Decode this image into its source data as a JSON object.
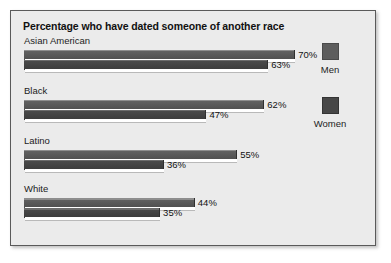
{
  "chart_data": {
    "type": "bar",
    "title": "Percentage who have dated someone of another race",
    "xlabel": "",
    "ylabel": "",
    "orientation": "horizontal",
    "grid": false,
    "xlim": [
      0,
      70
    ],
    "legend_position": "right",
    "categories": [
      "Asian American",
      "Black",
      "Latino",
      "White"
    ],
    "series": [
      {
        "name": "Men",
        "values": [
          70,
          62,
          55,
          44
        ]
      },
      {
        "name": "Women",
        "values": [
          63,
          47,
          36,
          35
        ]
      }
    ],
    "value_labels": {
      "Men": [
        "70%",
        "62%",
        "55%",
        "44%"
      ],
      "Women": [
        "63%",
        "47%",
        "36%",
        "35%"
      ]
    }
  },
  "groups": [
    {
      "label": "Asian American",
      "men_value": 70,
      "men_label": "70%",
      "women_value": 63,
      "women_label": "63%"
    },
    {
      "label": "Black",
      "men_value": 62,
      "men_label": "62%",
      "women_value": 47,
      "women_label": "47%"
    },
    {
      "label": "Latino",
      "men_value": 55,
      "men_label": "55%",
      "women_value": 36,
      "women_label": "36%"
    },
    {
      "label": "White",
      "men_value": 44,
      "men_label": "44%",
      "women_value": 35,
      "women_label": "35%"
    }
  ],
  "legend": {
    "items": [
      {
        "label": "Men",
        "color": "#5d5d5d"
      },
      {
        "label": "Women",
        "color": "#474747"
      }
    ]
  },
  "colors": {
    "background": "#ebebeb",
    "frame_border": "#5a5a5a",
    "men_bar": "#5d5d5d",
    "women_bar": "#474747",
    "text": "#1c1c1c"
  },
  "layout": {
    "px_per_percent": 3.86,
    "bar_origin_x": 13,
    "group_tops": [
      0,
      50,
      100,
      148
    ],
    "group_label_height": 15
  }
}
